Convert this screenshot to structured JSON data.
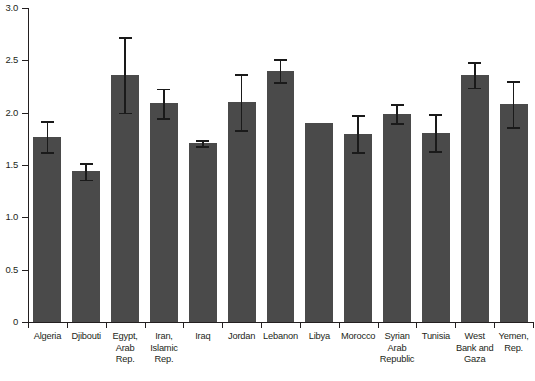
{
  "chart_data": {
    "type": "bar",
    "title": "",
    "subtitle": "",
    "xlabel": "",
    "ylabel": "",
    "ylim": [
      0,
      3.0
    ],
    "yticks": [
      0,
      0.5,
      1.0,
      1.5,
      2.0,
      2.5,
      3.0
    ],
    "ytick_labels": [
      "0",
      "0.5",
      "1.0",
      "1.5",
      "2.0",
      "2.5",
      "3.0"
    ],
    "grid": false,
    "legend": "none",
    "error_bars": "symmetric",
    "bar_color": "#4a4a4a",
    "error_color": "#1a1a1a",
    "axis_color": "#231f20",
    "categories": [
      "Algeria",
      "Djibouti",
      "Egypt,\nArab Rep.",
      "Iran,\nIslamic\nRep.",
      "Iraq",
      "Jordan",
      "Lebanon",
      "Libya",
      "Morocco",
      "Syrian\nArab\nRepublic",
      "Tunisia",
      "West\nBank and\nGaza",
      "Yemen,\nRep."
    ],
    "values": [
      1.77,
      1.44,
      2.36,
      2.09,
      1.71,
      2.1,
      2.4,
      1.9,
      1.8,
      1.99,
      1.81,
      2.36,
      2.08
    ],
    "errors": [
      0.15,
      0.08,
      0.36,
      0.14,
      0.03,
      0.27,
      0.11,
      0.0,
      0.18,
      0.09,
      0.18,
      0.12,
      0.22
    ]
  }
}
